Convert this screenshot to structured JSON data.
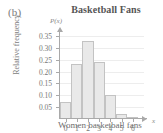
{
  "panel": {
    "label": "(b)"
  },
  "chart_data": {
    "type": "bar",
    "title": "Basketball Fans",
    "xlabel": "Women basketball fans",
    "ylabel": "Relative frequency",
    "y_axis_symbol": "P(x)",
    "x_axis_symbol": "x",
    "categories": [
      "0",
      "1",
      "2",
      "3",
      "4",
      "5",
      "6"
    ],
    "values": [
      0.07,
      0.23,
      0.33,
      0.24,
      0.1,
      0.02,
      0.01
    ],
    "ylim": [
      0,
      0.375
    ],
    "xlim": [
      0,
      7
    ],
    "yticks": [
      "0.05",
      "0.10",
      "0.15",
      "0.20",
      "0.25",
      "0.30",
      "0.35"
    ],
    "ytick_values": [
      0.05,
      0.1,
      0.15,
      0.2,
      0.25,
      0.3,
      0.35
    ],
    "grid": true,
    "legend": null,
    "colors": {
      "bar_fill": "#e9e9e9",
      "bar_stroke": "#c3c3c3",
      "axis": "#a9a9a9",
      "grid": "#ededed",
      "text": "#767676",
      "title": "#555555"
    }
  }
}
